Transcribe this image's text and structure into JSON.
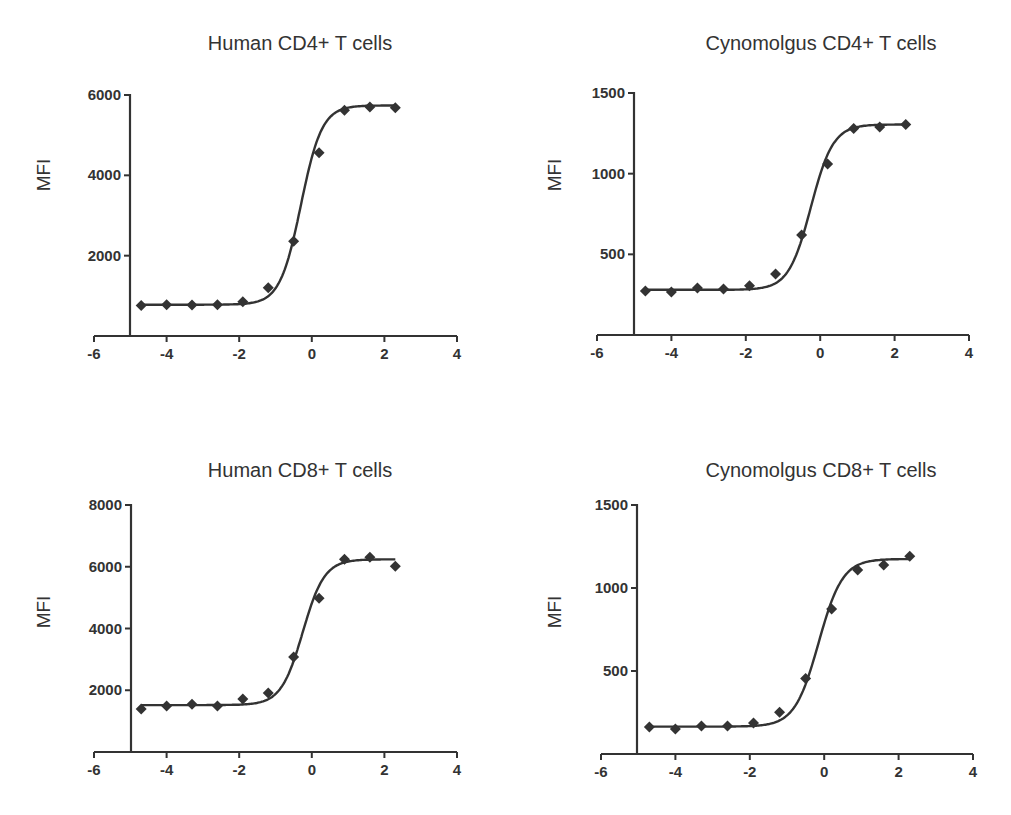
{
  "chart_data": [
    {
      "type": "scatter",
      "title": "Human CD4+ T cells",
      "xlabel": "",
      "ylabel": "MFI",
      "xlim": [
        -6,
        4
      ],
      "ylim": [
        0,
        6000
      ],
      "xticks": [
        -6,
        -4,
        -2,
        0,
        2,
        4
      ],
      "yticks": [
        2000,
        4000,
        6000
      ],
      "grid": false,
      "legend": null,
      "fit": "sigmoidal dose-response curve",
      "x": [
        -4.7,
        -4.0,
        -3.3,
        -2.6,
        -1.9,
        -1.2,
        -0.5,
        0.2,
        0.9,
        1.6,
        2.3
      ],
      "y": [
        760,
        780,
        770,
        780,
        850,
        1200,
        2360,
        4560,
        5620,
        5700,
        5680
      ],
      "fit_params": {
        "bottom": 780,
        "top": 5740,
        "logEC50": -0.3,
        "hill": 1.5
      },
      "layout": {
        "axis_x0": 94,
        "axis_x1": 457,
        "axis_y0": 336,
        "axis_y1": 95,
        "yaxis_x": 130,
        "title_x": 300,
        "title_y": 32,
        "ylabel_x": 44,
        "ylabel_y": 175
      }
    },
    {
      "type": "scatter",
      "title": "Cynomolgus CD4+ T cells",
      "xlabel": "",
      "ylabel": "MFI",
      "xlim": [
        -6,
        4
      ],
      "ylim": [
        0,
        1500
      ],
      "xticks": [
        -6,
        -4,
        -2,
        0,
        2,
        4
      ],
      "yticks": [
        500,
        1000,
        1500
      ],
      "grid": false,
      "legend": null,
      "fit": "sigmoidal dose-response curve",
      "x": [
        -4.7,
        -4.0,
        -3.3,
        -2.6,
        -1.9,
        -1.2,
        -0.5,
        0.2,
        0.9,
        1.6,
        2.3
      ],
      "y": [
        273,
        267,
        291,
        285,
        305,
        378,
        620,
        1060,
        1280,
        1290,
        1305
      ],
      "fit_params": {
        "bottom": 280,
        "top": 1305,
        "logEC50": -0.25,
        "hill": 1.45
      },
      "layout": {
        "axis_x0": 597,
        "axis_x1": 969,
        "axis_y0": 335,
        "axis_y1": 93,
        "yaxis_x": 634,
        "title_x": 821,
        "title_y": 32,
        "ylabel_x": 555,
        "ylabel_y": 175
      }
    },
    {
      "type": "scatter",
      "title": "Human CD8+ T cells",
      "xlabel": "",
      "ylabel": "MFI",
      "xlim": [
        -6,
        4
      ],
      "ylim": [
        0,
        8000
      ],
      "xticks": [
        -6,
        -4,
        -2,
        0,
        2,
        4
      ],
      "yticks": [
        2000,
        4000,
        6000,
        8000
      ],
      "grid": false,
      "legend": null,
      "fit": "sigmoidal dose-response curve",
      "x": [
        -4.7,
        -4.0,
        -3.3,
        -2.6,
        -1.9,
        -1.2,
        -0.5,
        0.2,
        0.9,
        1.6,
        2.3
      ],
      "y": [
        1390,
        1490,
        1550,
        1490,
        1720,
        1910,
        3080,
        4980,
        6240,
        6310,
        6020
      ],
      "fit_params": {
        "bottom": 1520,
        "top": 6240,
        "logEC50": -0.25,
        "hill": 1.45
      },
      "layout": {
        "axis_x0": 94,
        "axis_x1": 457,
        "axis_y0": 752,
        "axis_y1": 505,
        "yaxis_x": 131,
        "title_x": 300,
        "title_y": 459,
        "ylabel_x": 44,
        "ylabel_y": 612
      }
    },
    {
      "type": "scatter",
      "title": "Cynomolgus CD8+ T cells",
      "xlabel": "",
      "ylabel": "MFI",
      "xlim": [
        -6,
        4
      ],
      "ylim": [
        0,
        1500
      ],
      "xticks": [
        -6,
        -4,
        -2,
        0,
        2,
        4
      ],
      "yticks": [
        500,
        1000,
        1500
      ],
      "grid": false,
      "legend": null,
      "fit": "sigmoidal dose-response curve",
      "x": [
        -4.7,
        -4.0,
        -3.3,
        -2.6,
        -1.9,
        -1.2,
        -0.5,
        0.2,
        0.9,
        1.6,
        2.3
      ],
      "y": [
        162,
        150,
        168,
        168,
        186,
        251,
        455,
        874,
        1108,
        1138,
        1192
      ],
      "fit_params": {
        "bottom": 165,
        "top": 1175,
        "logEC50": -0.15,
        "hill": 1.35
      },
      "layout": {
        "axis_x0": 601,
        "axis_x1": 973,
        "axis_y0": 754,
        "axis_y1": 505,
        "yaxis_x": 637,
        "title_x": 821,
        "title_y": 459,
        "ylabel_x": 555,
        "ylabel_y": 612
      }
    }
  ],
  "colors": {
    "axis": "#333333",
    "curve": "#333333",
    "marker": "#333333",
    "text": "#333333",
    "background": "#ffffff"
  }
}
